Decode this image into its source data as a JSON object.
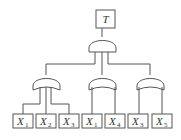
{
  "diagram": {
    "type": "fault-tree",
    "top_event": {
      "label": "T",
      "x": 96,
      "y": 10,
      "w": 19,
      "h": 18
    },
    "top_gate": {
      "type": "AND",
      "cx": 102,
      "x": 89,
      "w": 27,
      "top": 36,
      "base": 52,
      "legs": [
        95,
        102,
        108
      ],
      "leg_end": 64
    },
    "sub_gates": [
      {
        "id": "G1",
        "type": "OR",
        "cx": 46,
        "x": 33,
        "w": 27,
        "top": 74,
        "base": 90,
        "feed_from": 95,
        "legs": [
          40,
          46,
          51
        ],
        "children": [
          0,
          1,
          2
        ]
      },
      {
        "id": "G2",
        "type": "OR",
        "cx": 102,
        "x": 89,
        "w": 27,
        "top": 74,
        "base": 90,
        "feed_from": 102,
        "legs": [
          92,
          115
        ],
        "children": [
          3,
          4
        ]
      },
      {
        "id": "G3",
        "type": "OR",
        "cx": 150,
        "x": 137,
        "w": 27,
        "top": 74,
        "base": 90,
        "feed_from": 108,
        "legs": [
          139,
          162
        ],
        "children": [
          5,
          6
        ]
      }
    ],
    "bus_y": 64,
    "branch_y": 104,
    "basic_events": [
      {
        "label": "X",
        "sub": "1",
        "x": 13
      },
      {
        "label": "X",
        "sub": "2",
        "x": 36
      },
      {
        "label": "X",
        "sub": "3",
        "x": 59
      },
      {
        "label": "X",
        "sub": "1",
        "x": 82
      },
      {
        "label": "X",
        "sub": "4",
        "x": 105
      },
      {
        "label": "X",
        "sub": "3",
        "x": 128
      },
      {
        "label": "X",
        "sub": "5",
        "x": 152
      }
    ],
    "event_box": {
      "y": 114,
      "w": 20,
      "h": 14
    }
  }
}
